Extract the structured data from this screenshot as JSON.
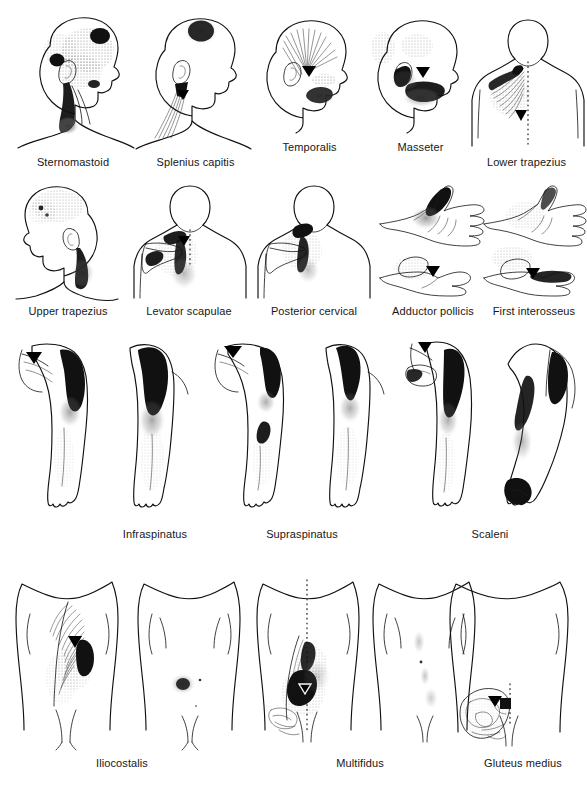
{
  "figure": {
    "kind": "anatomical-plate",
    "rows": 4,
    "panel_count": 13,
    "background_color": "#ffffff",
    "ink_color": "#111111",
    "caption_color": "#171717"
  },
  "row1": {
    "panels": [
      {
        "label": "Sternomastoid",
        "view": "lateral head and neck, facing right",
        "markings": "stippled referral over temple, cheek and occiput; dark blobs at forehead, over ear and along sternomastoid belly"
      },
      {
        "label": "Splenius capitis",
        "view": "lateral head and neck, facing right",
        "markings": "solid dark spot at vertex; striated muscle band down posterior neck with black trigger triangle below the ear"
      },
      {
        "label": "Temporalis",
        "view": "lateral head, facing right",
        "markings": "fan of radiating lines over the temple, black trigger triangle at the temple, stippled referral along upper teeth and jaw"
      },
      {
        "label": "Masseter",
        "view": "lateral head, facing right",
        "markings": "black trigger triangle in front of the ear, dark referral over the cheek and jaw angle, stippling over forehead and above ear"
      },
      {
        "label": "Lower trapezius",
        "view": "posterior upper back and neck",
        "markings": "dotted midline over the spine, striated referral fanning from the upper back into the neck, black trigger triangle beside the spine"
      }
    ]
  },
  "row2": {
    "panels": [
      {
        "label": "Upper trapezius",
        "view": "lateral head, neck and shoulder, facing left",
        "markings": "stippling over the side of the skull, dark referral column along the posterior neck"
      },
      {
        "label": "Levator scapulae",
        "view": "posterior neck, shoulder and scapula",
        "markings": "dark patch at neck/shoulder angle and along the medial scapular border, dotted spinal midline, black trigger triangle"
      },
      {
        "label": "Posterior cervical",
        "view": "posterior neck, shoulder and scapula",
        "markings": "dark referral at the base of the skull running down the neck and over the scapula"
      },
      {
        "label": "Adductor pollicis",
        "view": "two hands — dorsal above, palmar below",
        "markings": "dark referral over the thenar web space of the dorsal hand, black trigger triangle in the thumb web of the lower hand"
      },
      {
        "label": "First interosseus",
        "view": "two hands — dorsal above, palmar below",
        "markings": "stippled referral over the dorsal hand, dark band along the index finger with black trigger triangle in the web space"
      }
    ]
  },
  "row3": {
    "panels": [
      {
        "label": "Infraspinatus",
        "view": "two arms — posterior with scapula (left) and anterior (right)",
        "markings": "black trigger triangle on the scapula, dark referral over the shoulder cap running down the arm, stippling along the forearm to the hand"
      },
      {
        "label": "Supraspinatus",
        "view": "two arms — posterior with scapula (left) and anterior (right)",
        "markings": "black trigger triangle above the scapular spine, dark deltoid patch, second dark patch at the lateral elbow"
      },
      {
        "label": "Scaleni",
        "view": "two arms with neck — anterior (left) and posterior (right)",
        "markings": "black trigger triangle at the neck, dark bands down the front and back of the arm, dark referral over the hand and thumb"
      }
    ]
  },
  "row4": {
    "panels": [
      {
        "label": "Iliocostalis",
        "view": "torso pair — posterior (left) and anterior (right)",
        "markings": "ribcage hatching with black trigger triangle beside the spine, dark paraspinal referral; isolated dark spot on the abdomen of the anterior view"
      },
      {
        "label": "Multifidus",
        "view": "torso pair — posterior (left) and anterior (right)",
        "markings": "dotted spinal midline, heavy dark paraspinal referral with open trigger triangle, pelvis outline; faint anterior referral"
      },
      {
        "label": "Gluteus medius",
        "view": "posterior lower torso and buttock",
        "markings": "gluteal and pelvic outline with swirling detail, black trigger square at the iliac crest, dotted line along the lower spine"
      }
    ]
  }
}
